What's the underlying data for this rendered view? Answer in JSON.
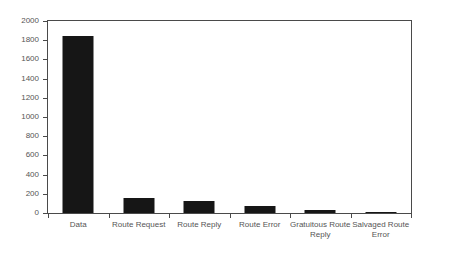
{
  "chart_data": {
    "type": "bar",
    "title": "",
    "subtitle": "",
    "xlabel": "",
    "ylabel": "",
    "categories": [
      "Data",
      "Route Request",
      "Route Reply",
      "Route Error",
      "Gratuitous Route Reply",
      "Salvaged Route Error"
    ],
    "category_lines": [
      [
        "Data"
      ],
      [
        "Route Request"
      ],
      [
        "Route Reply"
      ],
      [
        "Route Error"
      ],
      [
        "Gratuitous Route",
        "Reply"
      ],
      [
        "Salvaged Route",
        "Error"
      ]
    ],
    "values": [
      1840,
      160,
      120,
      70,
      30,
      5
    ],
    "ylim": [
      0,
      2000
    ],
    "ytick_values": [
      0,
      200,
      400,
      600,
      800,
      1000,
      1200,
      1400,
      1600,
      1800,
      2000
    ],
    "ytick_labels": [
      "0",
      "200",
      "400",
      "600",
      "800",
      "1000",
      "1200",
      "1400",
      "1600",
      "1800",
      "2000"
    ],
    "grid": false,
    "legend": "none",
    "bar_color": "#161616",
    "axis_color": "#4a4a4a",
    "label_color": "#555555",
    "background_color": "#ffffff"
  }
}
